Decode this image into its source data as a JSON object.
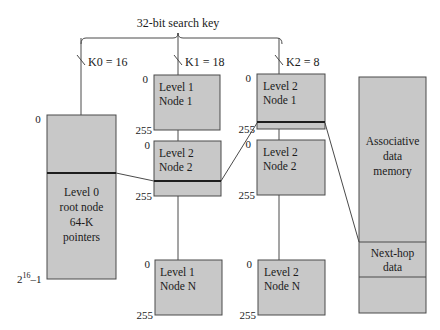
{
  "title": "32-bit search key",
  "keys": [
    {
      "label": "K0 = 16"
    },
    {
      "label": "K1 = 18"
    },
    {
      "label": "K2 = 8"
    }
  ],
  "level0": {
    "lines": [
      "Level 0",
      "root node",
      "64-K",
      "pointers"
    ],
    "index_top": "0",
    "index_bottom_base": "2",
    "index_bottom_exp": "16",
    "index_bottom_suffix": "–1"
  },
  "column1": {
    "nodes": [
      {
        "line1": "Level 1",
        "line2": "Node 1",
        "top": "0",
        "bottom": "255"
      },
      {
        "line1": "Level 2",
        "line2": "Node 2",
        "top": "0",
        "bottom": "255"
      },
      {
        "line1": "Level 1",
        "line2": "Node N",
        "top": "0",
        "bottom": "255"
      }
    ]
  },
  "column2": {
    "nodes": [
      {
        "line1": "Level 2",
        "line2": "Node 1",
        "top": "0",
        "bottom": "255"
      },
      {
        "line1": "Level 2",
        "line2": "Node 2",
        "top": "0",
        "bottom": "255"
      },
      {
        "line1": "Level 2",
        "line2": "Node N",
        "top": "0",
        "bottom": "255"
      }
    ]
  },
  "memory": {
    "lines": [
      "Associative",
      "data",
      "memory"
    ],
    "nexthop": [
      "Next-hop",
      "data"
    ]
  },
  "colors": {
    "box_fill": "#c8c8c8",
    "stroke": "#4a4a4a"
  }
}
